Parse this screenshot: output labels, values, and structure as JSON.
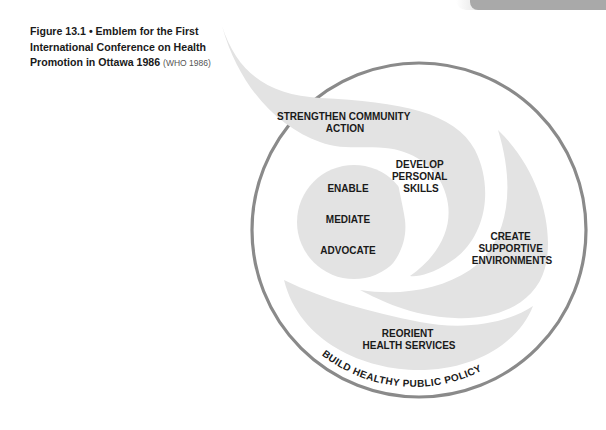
{
  "caption": {
    "title": "Figure 13.1 • Emblem for the First International Conference on Health Promotion in Ottawa 1986",
    "source": "(WHO 1986)"
  },
  "emblem": {
    "colors": {
      "fill": "#e3e3e3",
      "ring": "#8a8a8a",
      "text": "#1a1a1a",
      "header_bar": "#a9a9a9"
    },
    "labels": {
      "strengthen": [
        "STRENGTHEN COMMUNITY",
        "ACTION"
      ],
      "develop": [
        "DEVELOP",
        "PERSONAL",
        "SKILLS"
      ],
      "enable": "ENABLE",
      "mediate": "MEDIATE",
      "advocate": "ADVOCATE",
      "create": [
        "CREATE",
        "SUPPORTIVE",
        "ENVIRONMENTS"
      ],
      "reorient": [
        "REORIENT",
        "HEALTH SERVICES"
      ],
      "ring": "BUILD HEALTHY PUBLIC POLICY"
    }
  }
}
